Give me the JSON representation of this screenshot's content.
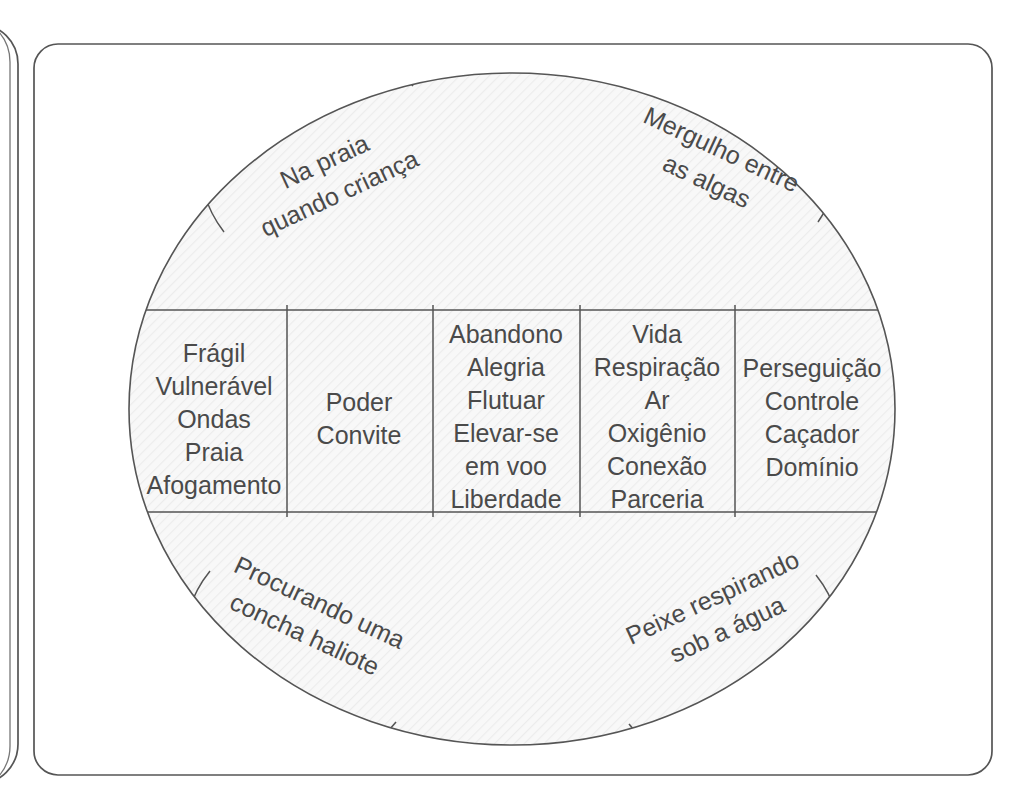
{
  "page": {
    "background_color": "#ffffff",
    "stroke_color": "#555555",
    "text_color": "#4a4a4a",
    "fill_color": "#f7f7f7"
  },
  "frame": {
    "name": "rounded-card-frame",
    "edge_fragment_name": "adjacent-page-fragment"
  },
  "diagram": {
    "type": "segmented-ellipse",
    "bubbles": [
      {
        "position": "top-left",
        "lines": [
          "Na praia",
          "quando criança"
        ],
        "rotation": -25
      },
      {
        "position": "top-right",
        "lines": [
          "Mergulho entre",
          "as algas"
        ],
        "rotation": 25
      },
      {
        "position": "bottom-left",
        "lines": [
          "Procurando uma",
          "concha haliote"
        ],
        "rotation": 25
      },
      {
        "position": "bottom-right",
        "lines": [
          "Peixe respirando",
          "sob a água"
        ],
        "rotation": -25
      }
    ],
    "columns": [
      {
        "index": 1,
        "lines": [
          "Frágil",
          "Vulnerável",
          "Ondas",
          "Praia",
          "Afogamento"
        ]
      },
      {
        "index": 2,
        "lines": [
          "Poder",
          "Convite"
        ]
      },
      {
        "index": 3,
        "lines": [
          "Abandono",
          "Alegria",
          "Flutuar",
          "Elevar-se",
          "em voo",
          "Liberdade"
        ]
      },
      {
        "index": 4,
        "lines": [
          "Vida",
          "Respiração",
          "Ar",
          "Oxigênio",
          "Conexão",
          "Parceria"
        ]
      },
      {
        "index": 5,
        "lines": [
          "Perseguição",
          "Controle",
          "Caçador",
          "Domínio"
        ]
      }
    ]
  }
}
